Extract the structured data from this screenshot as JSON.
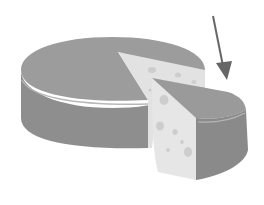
{
  "image": {
    "subject": "cheese wheel with a wedge cut out",
    "annotation": "arrow pointing at the cut wedge",
    "colors": {
      "background": "#ffffff",
      "rind_top": "#9a9a9a",
      "rind_side": "#8c8c8c",
      "rind_highlight": "#b4b4b4",
      "cut_face": "#e4e4e4",
      "holes": "#cfcfcf",
      "arrow": "#6a6a6a"
    }
  }
}
